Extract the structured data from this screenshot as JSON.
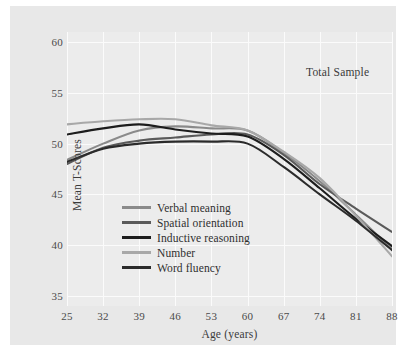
{
  "chart_data": {
    "type": "line",
    "title": "",
    "annotation": "Total Sample",
    "xlabel": "Age (years)",
    "ylabel": "Mean T-Scores",
    "x": [
      25,
      32,
      39,
      46,
      53,
      60,
      67,
      74,
      81,
      88
    ],
    "xticklabels": [
      "25",
      "32",
      "39",
      "46",
      "53",
      "60",
      "67",
      "74",
      "81",
      "88"
    ],
    "yticklabels": [
      "35",
      "40",
      "45",
      "50",
      "55",
      "60"
    ],
    "yticks": [
      35,
      40,
      45,
      50,
      55,
      60
    ],
    "xlim": [
      25,
      88
    ],
    "ylim": [
      34,
      61
    ],
    "grid": true,
    "legend_position": "lower-left-inside",
    "series": [
      {
        "name": "Verbal meaning",
        "color": "#8a8a8a",
        "values": [
          48.4,
          50.0,
          51.3,
          51.7,
          51.5,
          51.3,
          49.1,
          46.3,
          43.0,
          39.6
        ]
      },
      {
        "name": "Spatial orientation",
        "color": "#5a5a5a",
        "values": [
          48.0,
          49.6,
          50.3,
          50.6,
          50.9,
          50.9,
          48.9,
          46.0,
          43.6,
          41.3
        ]
      },
      {
        "name": "Inductive reasoning",
        "color": "#1d1d1d",
        "values": [
          50.9,
          51.5,
          51.9,
          51.4,
          51.0,
          50.7,
          48.5,
          45.6,
          42.6,
          39.9
        ]
      },
      {
        "name": "Number",
        "color": "#a8a8a8",
        "values": [
          51.9,
          52.2,
          52.4,
          52.4,
          51.8,
          51.3,
          49.2,
          46.6,
          42.9,
          38.9
        ]
      },
      {
        "name": "Word fluency",
        "color": "#2b2b2b",
        "values": [
          48.2,
          49.5,
          50.0,
          50.2,
          50.2,
          50.0,
          47.7,
          45.0,
          42.4,
          39.5
        ]
      }
    ]
  },
  "caption": ""
}
